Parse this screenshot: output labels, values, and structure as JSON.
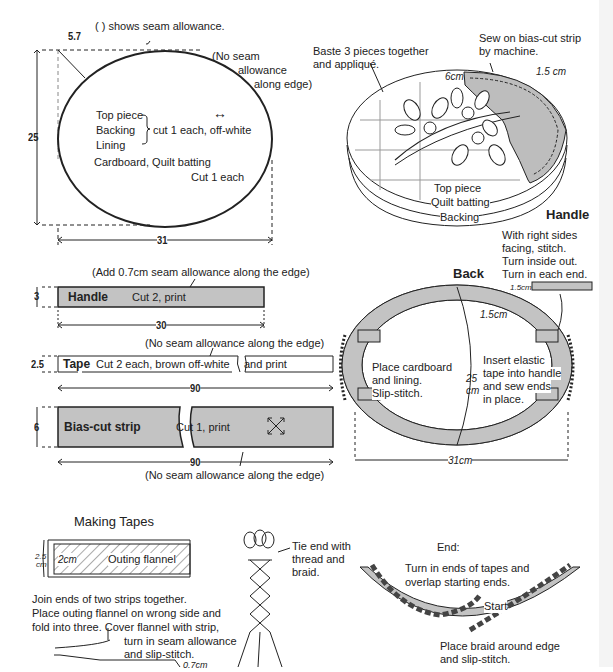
{
  "legend": {
    "seam_note": "(        ) shows seam allowance."
  },
  "oval_pattern": {
    "corner_dim": "5.7",
    "no_seam_note": [
      "(No seam",
      "allowance",
      "along edge)"
    ],
    "pieces": [
      "Top piece",
      "Backing",
      "Lining"
    ],
    "pieces_cut": "cut 1 each, off-white",
    "grain_icon": "↔",
    "other_pieces": "Cardboard, Quilt batting",
    "other_cut": "Cut 1 each",
    "height": "25",
    "width": "31"
  },
  "assembled_top": {
    "baste_note": [
      "Baste 3 pieces together",
      "and appliqué."
    ],
    "sew_note": [
      "Sew on bias-cut strip",
      "by machine."
    ],
    "dim_6cm": "6cm",
    "dim_1_5cm": "1.5 cm",
    "layers": [
      "Top piece",
      "Quilt batting",
      "Backing"
    ]
  },
  "handle_strip": {
    "note": "(Add 0.7cm seam allowance along the edge)",
    "label": "Handle",
    "cut": "Cut 2, print",
    "height": "3",
    "width": "30",
    "fill": "#c3c3c3"
  },
  "tape_strip": {
    "note": "(No seam allowance along the edge)",
    "label": "Tape",
    "cut_a": "Cut 2 each, brown off-white",
    "cut_b": "and print",
    "height": "2.5",
    "width": "90"
  },
  "bias_strip": {
    "label": "Bias-cut strip",
    "cut": "Cut 1, print",
    "grain_icon": "bias-arrows",
    "height": "6",
    "width": "90",
    "note": "(No seam allowance along the edge)",
    "fill": "#c3c3c3"
  },
  "handle_detail": {
    "title": "Handle",
    "steps": [
      "With right sides",
      "facing, stitch.",
      "Turn inside out.",
      "Turn in each end."
    ],
    "dim": "1.5cm"
  },
  "back_view": {
    "title": "Back",
    "dim_1_5": "1.5cm",
    "left_note": [
      "Place cardboard",
      "and lining.",
      "Slip-stitch."
    ],
    "right_note": [
      "Insert elastic",
      "tape into handle",
      "and sew ends",
      "in place."
    ],
    "height": [
      "25",
      "cm"
    ],
    "width": "31cm"
  },
  "making_tapes": {
    "title": "Making Tapes",
    "dim_2_5": [
      "2.5",
      "cm"
    ],
    "dim_2": "2cm",
    "flannel": "Outing flannel",
    "steps": [
      "Join ends of two strips together.",
      "Place outing flannel on wrong side and",
      "fold into three. Cover flannel with strip,"
    ],
    "slip_note": [
      "turn in seam allowance",
      "and slip-stitch."
    ],
    "dim_0_7": "0.7cm",
    "tie_note": [
      "Tie end with",
      "thread and",
      "braid."
    ]
  },
  "end_detail": {
    "title": "End:",
    "turn_note": [
      "Turn in ends of tapes and",
      "overlap starting ends."
    ],
    "start": "Start",
    "place_note": [
      "Place braid around edge",
      "and slip-stitch."
    ]
  }
}
